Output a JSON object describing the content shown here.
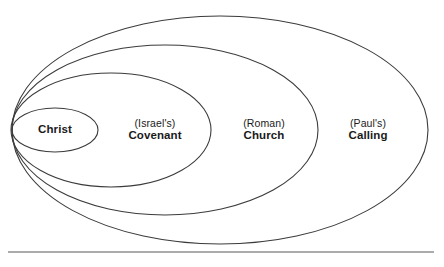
{
  "diagram": {
    "type": "nested-ellipses",
    "canvas": {
      "width": 444,
      "height": 267
    },
    "stroke_color": "#3b3b3b",
    "text_color": "#1a1a1a",
    "rule_color": "#8f8f8f",
    "background_color": "#ffffff",
    "rings": [
      {
        "name": "christ",
        "qualifier": "",
        "label": "Christ",
        "geometry": {
          "cx": 55,
          "cy": 130,
          "rx": 43,
          "ry": 22
        },
        "label_x": 55,
        "label_y": 130
      },
      {
        "name": "covenant",
        "qualifier": "(Israel's)",
        "label": "Covenant",
        "geometry": {
          "cx": 111,
          "cy": 130,
          "rx": 100,
          "ry": 57
        },
        "label_x": 155,
        "label_y": 130
      },
      {
        "name": "church",
        "qualifier": "(Roman)",
        "label": "Church",
        "geometry": {
          "cx": 165,
          "cy": 130,
          "rx": 153,
          "ry": 85
        },
        "label_x": 264,
        "label_y": 130
      },
      {
        "name": "calling",
        "qualifier": "(Paul's)",
        "label": "Calling",
        "geometry": {
          "cx": 220,
          "cy": 130,
          "rx": 208,
          "ry": 114
        },
        "label_x": 368,
        "label_y": 130
      }
    ],
    "baseline_rule": {
      "x1": 8,
      "y1": 252,
      "x2": 434,
      "y2": 252
    }
  }
}
